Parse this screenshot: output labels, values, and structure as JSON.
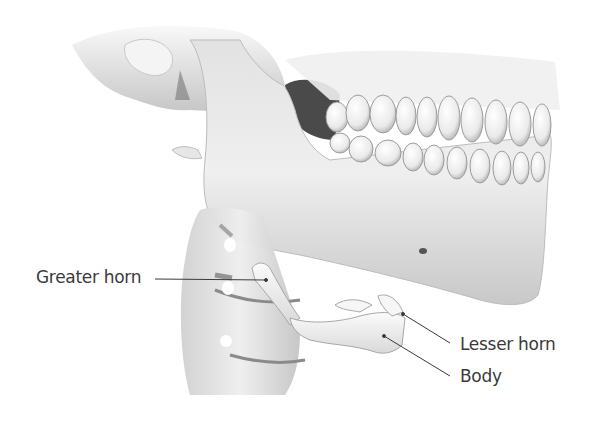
{
  "figure": {
    "labels": [
      {
        "id": "greater-horn",
        "text": "Greater horn",
        "x": 36,
        "y": 267,
        "line": [
          155,
          279,
          266,
          280
        ]
      },
      {
        "id": "lesser-horn",
        "text": "Lesser horn",
        "x": 460,
        "y": 334,
        "line": [
          403,
          314,
          450,
          343
        ]
      },
      {
        "id": "body",
        "text": "Body",
        "x": 460,
        "y": 366,
        "line": [
          384,
          336,
          450,
          376
        ]
      }
    ],
    "colors": {
      "background": "#ffffff",
      "bone_light": "#f2f2f2",
      "bone_mid": "#d6d6d6",
      "bone_shadow": "#9a9a9a",
      "cavity": "#4a4a4a",
      "label_text": "#3a3a3a",
      "leader_line": "#3a3a3a"
    }
  }
}
